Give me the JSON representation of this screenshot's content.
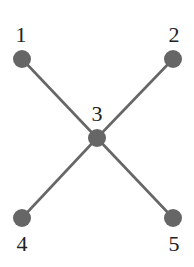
{
  "diagram": {
    "type": "graph",
    "colors": {
      "node": "#666666",
      "edge": "#666666",
      "label": "#222222",
      "background": "#ffffff"
    },
    "nodes": [
      {
        "id": "1",
        "label": "1",
        "x": 22,
        "y": 59,
        "label_x": 21,
        "label_y": 42
      },
      {
        "id": "2",
        "label": "2",
        "x": 173,
        "y": 59,
        "label_x": 174,
        "label_y": 42
      },
      {
        "id": "3",
        "label": "3",
        "x": 97,
        "y": 138,
        "label_x": 97,
        "label_y": 121
      },
      {
        "id": "4",
        "label": "4",
        "x": 22,
        "y": 218,
        "label_x": 22,
        "label_y": 251
      },
      {
        "id": "5",
        "label": "5",
        "x": 173,
        "y": 218,
        "label_x": 174,
        "label_y": 251
      }
    ],
    "edges": [
      {
        "from": "1",
        "to": "3"
      },
      {
        "from": "2",
        "to": "3"
      },
      {
        "from": "3",
        "to": "4"
      },
      {
        "from": "3",
        "to": "5"
      }
    ]
  }
}
